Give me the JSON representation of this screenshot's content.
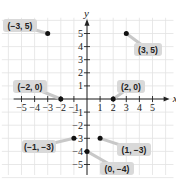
{
  "chart_data": {
    "type": "scatter",
    "title": "",
    "xlabel": "x",
    "ylabel": "y",
    "xlim": [
      -5,
      5
    ],
    "ylim": [
      -5,
      5
    ],
    "grid": true,
    "x_ticks": [
      "-5",
      "-4",
      "-3",
      "-2",
      "-1",
      "1",
      "2",
      "3",
      "4",
      "5"
    ],
    "y_ticks": [
      "5",
      "4",
      "3",
      "2",
      "1",
      "-1",
      "-2",
      "-3",
      "-4",
      "-5"
    ],
    "points": [
      {
        "x": -3,
        "y": 5,
        "label": "(−3, 5)"
      },
      {
        "x": 3,
        "y": 5,
        "label": "(3, 5)"
      },
      {
        "x": -2,
        "y": 0,
        "label": "(−2, 0)"
      },
      {
        "x": 2,
        "y": 0,
        "label": "(2, 0)"
      },
      {
        "x": -1,
        "y": -3,
        "label": "(−1, −3)"
      },
      {
        "x": 1,
        "y": -3,
        "label": "(1, −3)"
      },
      {
        "x": 0,
        "y": -4,
        "label": "(0, −4)"
      }
    ]
  },
  "colors": {
    "grid": "#e2e2e2",
    "axis": "#222222",
    "point": "#111111",
    "label_bg": "#d9d9d9"
  }
}
